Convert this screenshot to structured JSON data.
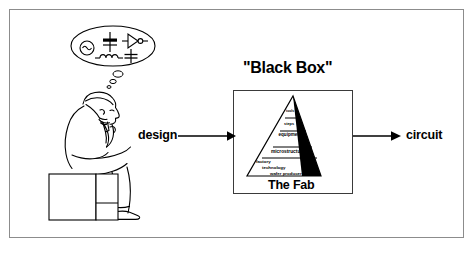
{
  "figure": {
    "kind": "conceptual-block-diagram",
    "border_color": "#8c8c8c",
    "ink_color": "#000000",
    "background": "#ffffff"
  },
  "thinker": {
    "name": "seated-thinking-designer",
    "pose": "the-thinker",
    "seat": "cube-block"
  },
  "thought_bubble": {
    "name": "thought-bubble",
    "symbols": [
      {
        "name": "ac-source-symbol",
        "label": "AC source"
      },
      {
        "name": "transistor-symbol",
        "label": "transistor"
      },
      {
        "name": "logic-gate-symbol",
        "label": "logic gate"
      },
      {
        "name": "inductor-symbol",
        "label": "inductor"
      },
      {
        "name": "capacitor-symbol",
        "label": "capacitor"
      }
    ],
    "trail_bubbles": 3
  },
  "flow": {
    "input_label": "design",
    "output_label": "circuit",
    "box_title": "\"Black Box\"",
    "box_caption": "The Fab"
  },
  "pyramid": {
    "name": "fab-hierarchy-pyramid",
    "caption": "The Fab",
    "shadow_color": "#000000",
    "layers": [
      {
        "index": 0,
        "label": "tools"
      },
      {
        "index": 1,
        "label": "steps"
      },
      {
        "index": 2,
        "label": "equipment"
      },
      {
        "index": 3,
        "label": "microstructures"
      },
      {
        "index": 4,
        "label": "factory"
      },
      {
        "index": 5,
        "label": "technology"
      },
      {
        "index": 6,
        "label": "wafer producer"
      }
    ]
  },
  "arrows": {
    "in": {
      "name": "arrow-design-to-box"
    },
    "out": {
      "name": "arrow-box-to-circuit"
    }
  }
}
